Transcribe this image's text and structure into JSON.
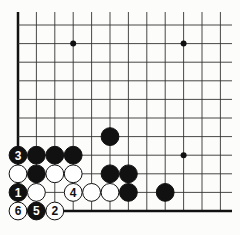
{
  "diagram": {
    "type": "go-board-fragment",
    "grid": {
      "x0": 18,
      "y0": 25,
      "dx": 18.4,
      "dy": 18.6,
      "cols": 12,
      "rows": 11,
      "left_edge": true,
      "bottom_edge": true,
      "line_color": "#333333",
      "edge_color": "#111111"
    },
    "star_points": [
      [
        3,
        1
      ],
      [
        9,
        1
      ],
      [
        9,
        7
      ]
    ],
    "stones": [
      {
        "col": 5,
        "row": 6,
        "color": "black",
        "label": ""
      },
      {
        "col": 0,
        "row": 7,
        "color": "black",
        "label": "3"
      },
      {
        "col": 1,
        "row": 7,
        "color": "black",
        "label": ""
      },
      {
        "col": 2,
        "row": 7,
        "color": "black",
        "label": ""
      },
      {
        "col": 3,
        "row": 7,
        "color": "black",
        "label": ""
      },
      {
        "col": 0,
        "row": 8,
        "color": "white",
        "label": ""
      },
      {
        "col": 1,
        "row": 8,
        "color": "black",
        "label": ""
      },
      {
        "col": 2,
        "row": 8,
        "color": "white",
        "label": ""
      },
      {
        "col": 3,
        "row": 8,
        "color": "white",
        "label": ""
      },
      {
        "col": 5,
        "row": 8,
        "color": "black",
        "label": ""
      },
      {
        "col": 6,
        "row": 8,
        "color": "black",
        "label": ""
      },
      {
        "col": 0,
        "row": 9,
        "color": "black",
        "label": "1"
      },
      {
        "col": 1,
        "row": 9,
        "color": "white",
        "label": ""
      },
      {
        "col": 3,
        "row": 9,
        "color": "white",
        "label": "4"
      },
      {
        "col": 4,
        "row": 9,
        "color": "white",
        "label": ""
      },
      {
        "col": 5,
        "row": 9,
        "color": "white",
        "label": ""
      },
      {
        "col": 6,
        "row": 9,
        "color": "black",
        "label": ""
      },
      {
        "col": 8,
        "row": 9,
        "color": "black",
        "label": ""
      },
      {
        "col": 0,
        "row": 10,
        "color": "white",
        "label": "6"
      },
      {
        "col": 1,
        "row": 10,
        "color": "black",
        "label": "5"
      },
      {
        "col": 2,
        "row": 10,
        "color": "white",
        "label": "2"
      }
    ]
  }
}
